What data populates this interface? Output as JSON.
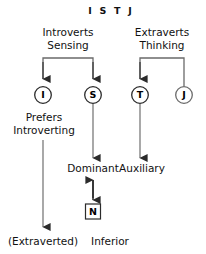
{
  "title": "I S T J",
  "headers": {
    "left": {
      "line1": "Introverts",
      "line2": "Sensing"
    },
    "right": {
      "line1": "Extraverts",
      "line2": "Thinking"
    }
  },
  "nodes": [
    {
      "id": "I",
      "letter": "I",
      "x": 43,
      "y": 95
    },
    {
      "id": "S",
      "letter": "S",
      "x": 93,
      "y": 95
    },
    {
      "id": "T",
      "letter": "T",
      "x": 140,
      "y": 95
    },
    {
      "id": "J",
      "letter": "J",
      "x": 184,
      "y": 95
    }
  ],
  "boxed_node": {
    "letter": "N",
    "x": 93,
    "y": 212
  },
  "labels": {
    "prefers_line1": "Prefers",
    "prefers_line2": "Introverting",
    "dominant": "Dominant",
    "auxiliary": "Auxiliary",
    "extraverted": "(Extraverted)",
    "inferior": "Inferior"
  },
  "colors": {
    "stroke": "#5a5a5a",
    "stroke_dark": "#2b2b2b",
    "text": "#111111",
    "background": "#ffffff"
  }
}
